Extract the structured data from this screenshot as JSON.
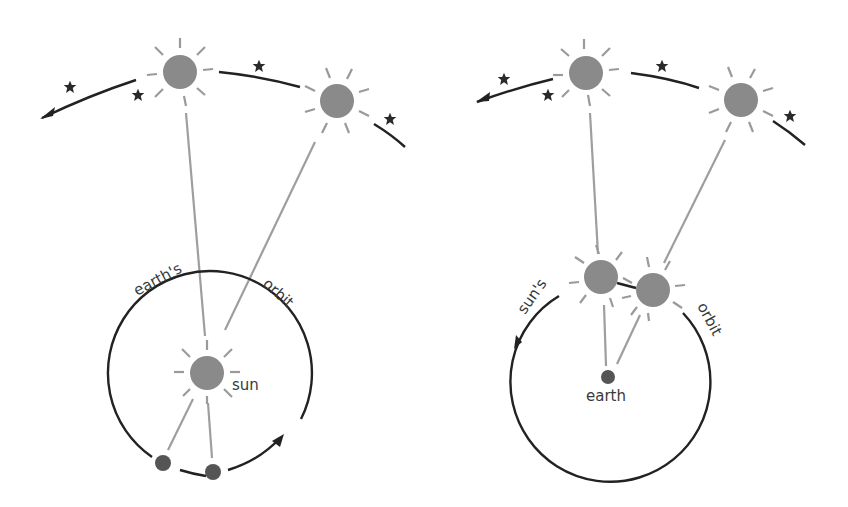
{
  "figure": {
    "colors": {
      "sun": "#8a8a8a",
      "sun_rays": "#9a9a9a",
      "sight_lines": "#9e9e9e",
      "paths": "#222222",
      "stars": "#2a2a2a",
      "earth": "#555555",
      "background": "#ffffff"
    }
  },
  "left_panel": {
    "title": "heliocentric view",
    "labels": {
      "orbit_left": "earth's",
      "orbit_right": "orbit",
      "sun": "sun"
    },
    "elements": {
      "apparent_suns_on_sky": 2,
      "background_stars": 4,
      "earth_positions": 2,
      "orbit_direction": "counterclockwise",
      "sky_path_direction": "leftward"
    }
  },
  "right_panel": {
    "title": "geocentric view",
    "labels": {
      "orbit_left": "sun's",
      "orbit_right": "orbit",
      "earth": "earth"
    },
    "elements": {
      "apparent_suns_on_sky": 2,
      "background_stars": 4,
      "sun_positions_on_orbit": 2,
      "orbit_direction": "counterclockwise",
      "sky_path_direction": "leftward"
    }
  }
}
